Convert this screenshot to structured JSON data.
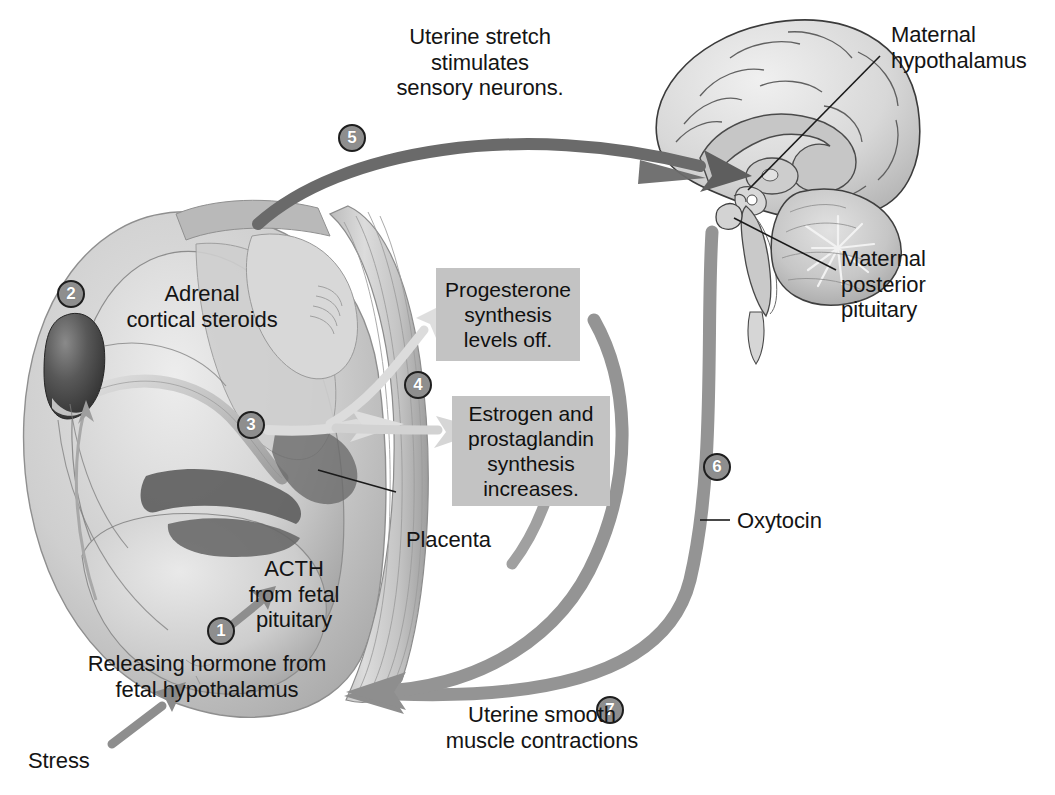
{
  "steps": [
    {
      "id": "1",
      "number": "1"
    },
    {
      "id": "2",
      "number": "2"
    },
    {
      "id": "3",
      "number": "3"
    },
    {
      "id": "4",
      "number": "4"
    },
    {
      "id": "5",
      "number": "5"
    },
    {
      "id": "6",
      "number": "6"
    },
    {
      "id": "7",
      "number": "7"
    }
  ],
  "labels": {
    "uterine_stretch": "Uterine stretch\nstimulates\nsensory neurons.",
    "maternal_hypothalamus": "Maternal\nhypothalamus",
    "maternal_posterior_pituitary": "Maternal\nposterior\npituitary",
    "adrenal_cortical_steroids": "Adrenal\ncortical steroids",
    "placenta": "Placenta",
    "acth": "ACTH\nfrom fetal\npituitary",
    "releasing_hormone": "Releasing hormone from\nfetal hypothalamus",
    "stress": "Stress",
    "oxytocin": "Oxytocin",
    "uterine_contractions": "Uterine smooth\nmuscle contractions"
  },
  "boxes": [
    {
      "id": "progesterone",
      "text": "Progesterone\nsynthesis\nlevels off."
    },
    {
      "id": "estrogen",
      "text": "Estrogen and\nprostaglandin\nsynthesis\nincreases."
    }
  ],
  "colors": {
    "text": "#141414",
    "box_fill": "#c3c3c3",
    "step_fill": "#8e8e8e",
    "step_border": "#1e1e1e",
    "dark_arrow": "#6a6a6a",
    "mid_arrow": "#949494",
    "light_arrow": "#d6d6d6",
    "leader_line": "#1a1a1a",
    "background": "#ffffff"
  },
  "illustrations": {
    "fetus_in_utero": "fetus-in-utero-illustration",
    "brain_sagittal": "maternal-brain-sagittal-illustration"
  }
}
